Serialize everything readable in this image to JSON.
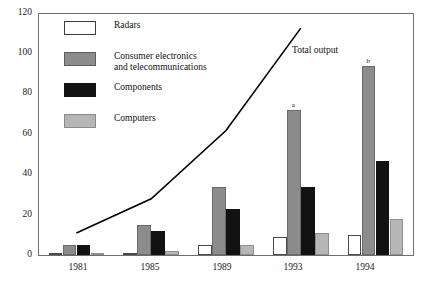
{
  "chart_data": {
    "type": "bar",
    "title": "",
    "subtitle": "",
    "xlabel": "",
    "ylabel": "",
    "categories": [
      "1981",
      "1985",
      "1989",
      "1993",
      "1994"
    ],
    "ylim": [
      0,
      120
    ],
    "yticks": [
      0,
      20,
      40,
      60,
      80,
      100,
      120
    ],
    "grid": false,
    "legend_position": "top-left",
    "series": [
      {
        "name": "Radars",
        "color": "#ffffff",
        "values": [
          0,
          0.5,
          5,
          9,
          10
        ]
      },
      {
        "name": "Consumer electronics and telecommunications",
        "color": "#8c8c8c",
        "values": [
          5,
          15,
          34,
          72,
          94
        ]
      },
      {
        "name": "Components",
        "color": "#121212",
        "values": [
          5,
          12,
          23,
          34,
          47
        ]
      },
      {
        "name": "Computers",
        "color": "#b6b6b6",
        "values": [
          1,
          2,
          5,
          11,
          18
        ]
      }
    ],
    "overlay_line": {
      "name": "Total output",
      "x": [
        "1981",
        "1985",
        "1989",
        "1993"
      ],
      "values": [
        11,
        28,
        62,
        113
      ]
    },
    "annotations": [
      {
        "text": "a",
        "series": "Consumer electronics and telecommunications",
        "category": "1993"
      },
      {
        "text": "b",
        "series": "Consumer electronics and telecommunications",
        "category": "1994"
      }
    ]
  },
  "axis": {
    "y_tick_labels": [
      "120",
      "100",
      "80",
      "60",
      "40",
      "20",
      "0"
    ],
    "x_tick_labels": [
      "1981",
      "1985",
      "1989",
      "1993",
      "1994"
    ]
  },
  "legend": {
    "items": [
      {
        "label": "Radars",
        "key": "radars"
      },
      {
        "label": "Consumer electronics\nand telecommunications",
        "key": "consumer"
      },
      {
        "label": "Components",
        "key": "components"
      },
      {
        "label": "Computers",
        "key": "computers"
      }
    ]
  },
  "line_series": {
    "label": "Total output"
  }
}
